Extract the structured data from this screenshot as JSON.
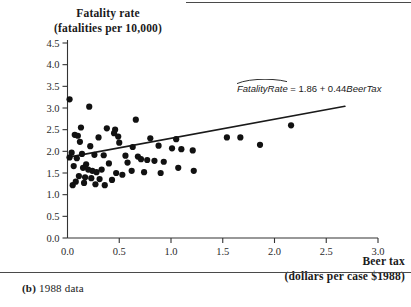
{
  "figure": {
    "caption_label": "(b)",
    "caption_text": "1988 data",
    "y_axis_title_line1": "Fatality rate",
    "y_axis_title_line2": "(fatalities per 10,000)",
    "x_axis_title_line1": "Beer tax",
    "x_axis_title_line2": "(dollars per case $1988)"
  },
  "chart_data": {
    "type": "scatter",
    "title": "",
    "subtitle": "",
    "xlabel": "Beer tax (dollars per case $1988)",
    "ylabel": "Fatality rate (fatalities per 10,000)",
    "xlim": [
      0.0,
      3.0
    ],
    "ylim": [
      0.0,
      4.5
    ],
    "xticks": [
      "0.0",
      "0.5",
      "1.0",
      "1.5",
      "2.0",
      "2.5",
      "3.0"
    ],
    "yticks": [
      "0.0",
      "0.5",
      "1.0",
      "1.5",
      "2.0",
      "2.5",
      "3.0",
      "3.5",
      "4.0",
      "4.5"
    ],
    "xtick_values": [
      0.0,
      0.5,
      1.0,
      1.5,
      2.0,
      2.5,
      3.0
    ],
    "ytick_values": [
      0.0,
      0.5,
      1.0,
      1.5,
      2.0,
      2.5,
      3.0,
      3.5,
      4.0,
      4.5
    ],
    "grid": false,
    "legend": null,
    "marker": "filled-circle",
    "marker_color": "#111111",
    "marker_size_px": 3.1,
    "annotation": {
      "text": "FatalityRate = 1.86 + 0.44BeerTax",
      "variable_1": "FatalityRate",
      "variable_1_hat": true,
      "intercept": 1.86,
      "slope": 0.44,
      "variable_2": "BeerTax",
      "position": [
        1.62,
        3.05
      ]
    },
    "fit_line": {
      "type": "ols",
      "intercept": 1.86,
      "slope": 0.44,
      "x_start": 0.0,
      "x_end": 2.68,
      "color": "#1a1a1a",
      "width_px": 1.6
    },
    "points": [
      [
        0.02,
        3.2
      ],
      [
        0.21,
        3.03
      ],
      [
        0.66,
        2.73
      ],
      [
        2.16,
        2.6
      ],
      [
        0.13,
        2.55
      ],
      [
        0.38,
        2.53
      ],
      [
        0.46,
        2.5
      ],
      [
        0.45,
        2.42
      ],
      [
        0.07,
        2.38
      ],
      [
        0.1,
        2.36
      ],
      [
        0.49,
        2.34
      ],
      [
        0.3,
        2.32
      ],
      [
        0.8,
        2.3
      ],
      [
        1.05,
        2.28
      ],
      [
        1.54,
        2.32
      ],
      [
        0.12,
        2.22
      ],
      [
        0.5,
        2.2
      ],
      [
        0.22,
        2.12
      ],
      [
        0.63,
        2.1
      ],
      [
        0.88,
        2.13
      ],
      [
        1.01,
        2.07
      ],
      [
        1.1,
        2.05
      ],
      [
        1.21,
        2.02
      ],
      [
        0.04,
        1.97
      ],
      [
        0.14,
        1.94
      ],
      [
        0.26,
        1.92
      ],
      [
        0.35,
        1.91
      ],
      [
        0.56,
        1.9
      ],
      [
        0.68,
        1.88
      ],
      [
        1.67,
        2.32
      ],
      [
        1.86,
        2.15
      ],
      [
        0.02,
        1.86
      ],
      [
        0.09,
        1.84
      ],
      [
        0.71,
        1.82
      ],
      [
        0.77,
        1.8
      ],
      [
        0.84,
        1.78
      ],
      [
        0.93,
        1.76
      ],
      [
        0.58,
        1.74
      ],
      [
        0.4,
        1.72
      ],
      [
        0.18,
        1.7
      ],
      [
        0.06,
        1.66
      ],
      [
        0.15,
        1.62
      ],
      [
        0.2,
        1.58
      ],
      [
        0.24,
        1.55
      ],
      [
        0.28,
        1.52
      ],
      [
        0.33,
        1.58
      ],
      [
        0.47,
        1.5
      ],
      [
        0.53,
        1.46
      ],
      [
        0.62,
        1.55
      ],
      [
        0.74,
        1.52
      ],
      [
        0.9,
        1.5
      ],
      [
        1.07,
        1.62
      ],
      [
        1.22,
        1.55
      ],
      [
        0.11,
        1.43
      ],
      [
        0.17,
        1.4
      ],
      [
        0.23,
        1.38
      ],
      [
        0.31,
        1.36
      ],
      [
        0.08,
        1.3
      ],
      [
        0.16,
        1.27
      ],
      [
        0.27,
        1.24
      ],
      [
        0.36,
        1.22
      ],
      [
        0.43,
        1.34
      ],
      [
        0.05,
        1.22
      ]
    ]
  }
}
